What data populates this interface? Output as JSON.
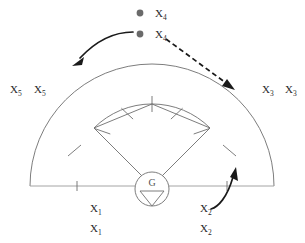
{
  "diagram": {
    "type": "sector-antenna-coverage-schematic",
    "center_node": {
      "label": "G",
      "icon": "down-triangle-icon"
    },
    "markers": [
      {
        "name": "marker-x4-upper",
        "label": "X",
        "subscript": "4",
        "icon": "filled-circle-dot",
        "x": 140,
        "y": 13
      },
      {
        "name": "marker-x4-lower",
        "label": "X",
        "subscript": "4",
        "icon": "filled-circle-dot",
        "x": 140,
        "y": 34
      }
    ],
    "labels": [
      {
        "name": "label-x5-a",
        "text": "X",
        "sub": "5",
        "x": 10,
        "y": 93
      },
      {
        "name": "label-x5-b",
        "text": "X",
        "sub": "5",
        "x": 34,
        "y": 93
      },
      {
        "name": "label-x3-a",
        "text": "X",
        "sub": "3",
        "x": 262,
        "y": 93
      },
      {
        "name": "label-x3-b",
        "text": "X",
        "sub": "3",
        "x": 285,
        "y": 93
      },
      {
        "name": "label-x1-a",
        "text": "X",
        "sub": "1",
        "x": 90,
        "y": 212
      },
      {
        "name": "label-x1-b",
        "text": "X",
        "sub": "1",
        "x": 90,
        "y": 232
      },
      {
        "name": "label-x2-a",
        "text": "X",
        "sub": "2",
        "x": 200,
        "y": 212
      },
      {
        "name": "label-x2-b",
        "text": "X",
        "sub": "2",
        "x": 200,
        "y": 232
      }
    ],
    "arrows": [
      {
        "name": "arrow-left-curved",
        "style": "solid",
        "direction": "down-left"
      },
      {
        "name": "arrow-right-dashed",
        "style": "dashed",
        "direction": "down-right"
      },
      {
        "name": "arrow-bottom-curved",
        "style": "solid",
        "direction": "up"
      }
    ],
    "geometry": {
      "center_x": 152,
      "baseline_y": 186,
      "outer_radius": 122,
      "inner_radius": 82,
      "sector_half_angle_deg": 45,
      "baseline_tick_count": 2,
      "inner_arc_tick_count": 5,
      "side_tick_count": 2
    },
    "colors": {
      "line": "#6e6e6e",
      "faint_line": "#9a9a9a",
      "arrow": "#1a1a1a",
      "dot": "#6a6a6a",
      "text": "#2b2b2b",
      "background": "#ffffff"
    }
  }
}
